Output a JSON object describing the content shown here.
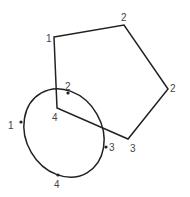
{
  "diagram": {
    "stroke_color": "#222222",
    "label_color": "#444444",
    "pentagon": {
      "vertices": [
        [
          54,
          37
        ],
        [
          124,
          25
        ],
        [
          168,
          89
        ],
        [
          128,
          139
        ],
        [
          57,
          108
        ]
      ],
      "labels": [
        {
          "text": "1",
          "x": 46,
          "y": 42
        },
        {
          "text": "2",
          "x": 121,
          "y": 21
        },
        {
          "text": "2",
          "x": 170,
          "y": 92
        },
        {
          "text": "3",
          "x": 130,
          "y": 152
        },
        {
          "text": "4",
          "x": 52,
          "y": 121
        }
      ]
    },
    "ellipse": {
      "cx": 64,
      "cy": 133,
      "rx": 38,
      "ry": 46,
      "rotate": -30,
      "grips": [
        [
          21,
          122
        ],
        [
          68,
          93
        ],
        [
          106,
          147
        ],
        [
          58,
          175
        ]
      ],
      "labels": [
        {
          "text": "1",
          "x": 8,
          "y": 129
        },
        {
          "text": "2",
          "x": 65,
          "y": 90
        },
        {
          "text": "3",
          "x": 109,
          "y": 151
        },
        {
          "text": "4",
          "x": 54,
          "y": 188
        }
      ]
    }
  }
}
